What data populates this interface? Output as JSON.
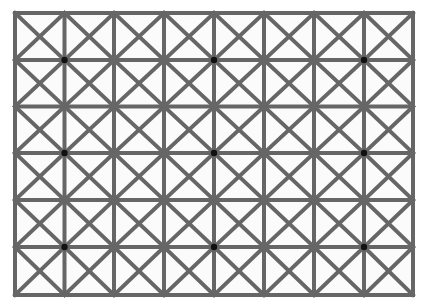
{
  "illusion": {
    "type": "extinction-grid",
    "background_color": "#ffffff",
    "cell_fill": "#fbfbfb",
    "line_color": "#666666",
    "line_width": 4,
    "dot_color": "#111111",
    "dot_radius": 3.2,
    "grid": {
      "x_lines": [
        15,
        64.5,
        114,
        164,
        214,
        264,
        314,
        364,
        413
      ],
      "y_lines": [
        13,
        60,
        106.5,
        153,
        200,
        247,
        295
      ],
      "columns": 8,
      "rows": 6,
      "diagonals_per_cell": true
    },
    "dots": [
      {
        "x": 64.5,
        "y": 60
      },
      {
        "x": 214,
        "y": 60
      },
      {
        "x": 364,
        "y": 60
      },
      {
        "x": 64.5,
        "y": 153
      },
      {
        "x": 214,
        "y": 153
      },
      {
        "x": 364,
        "y": 153
      },
      {
        "x": 64.5,
        "y": 247
      },
      {
        "x": 214,
        "y": 247
      },
      {
        "x": 364,
        "y": 247
      }
    ]
  }
}
